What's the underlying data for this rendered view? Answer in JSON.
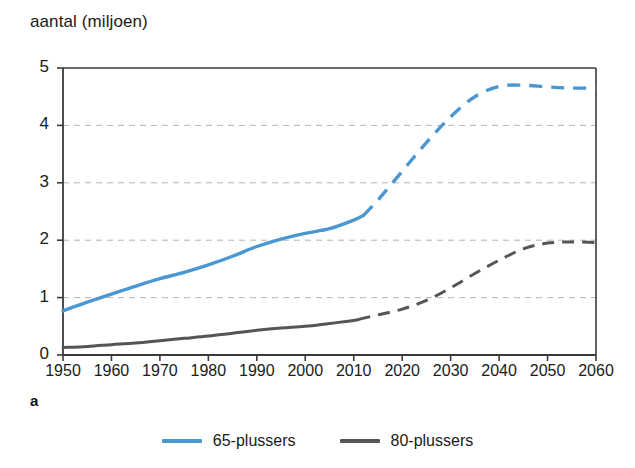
{
  "figure": {
    "axis_title": "aantal (miljoen)",
    "panel_label": "a"
  },
  "legend": {
    "position": "bottom-center",
    "entries": [
      {
        "label": "65-plussers",
        "color": "#4a97d2"
      },
      {
        "label": "80-plussers",
        "color": "#555555"
      }
    ]
  },
  "axes": {
    "y_ticks": [
      "0",
      "1",
      "2",
      "3",
      "4",
      "5"
    ],
    "x_ticks": [
      "1950",
      "1960",
      "1970",
      "1980",
      "1990",
      "2000",
      "2010",
      "2020",
      "2030",
      "2040",
      "2050",
      "2060"
    ]
  },
  "chart_data": {
    "type": "line",
    "title": "",
    "subtitle": "",
    "xlabel": "",
    "ylabel": "aantal (miljoen)",
    "xlim": [
      1950,
      2060
    ],
    "ylim": [
      0,
      5
    ],
    "grid": "horizontal-dashed",
    "legend_position": "bottom-center",
    "annotations": [
      "a"
    ],
    "x_ticks": [
      1950,
      1960,
      1970,
      1980,
      1990,
      2000,
      2010,
      2020,
      2030,
      2040,
      2050,
      2060
    ],
    "y_ticks": [
      0,
      1,
      2,
      3,
      4,
      5
    ],
    "series": [
      {
        "name": "65-plussers",
        "color": "#4a97d2",
        "observed_until": 2012,
        "x": [
          1950,
          1955,
          1960,
          1965,
          1970,
          1975,
          1980,
          1985,
          1990,
          1995,
          2000,
          2005,
          2010,
          2012,
          2015,
          2020,
          2025,
          2030,
          2035,
          2040,
          2045,
          2050,
          2055,
          2060
        ],
        "values": [
          0.77,
          0.92,
          1.06,
          1.2,
          1.33,
          1.44,
          1.57,
          1.72,
          1.89,
          2.02,
          2.12,
          2.2,
          2.35,
          2.43,
          2.7,
          3.2,
          3.7,
          4.15,
          4.5,
          4.68,
          4.7,
          4.67,
          4.65,
          4.65
        ],
        "style_observed": "solid",
        "style_projected": "dashed"
      },
      {
        "name": "80-plussers",
        "color": "#555555",
        "observed_until": 2011,
        "x": [
          1950,
          1955,
          1960,
          1965,
          1970,
          1975,
          1980,
          1985,
          1990,
          1995,
          2000,
          2005,
          2010,
          2011,
          2015,
          2020,
          2025,
          2030,
          2035,
          2040,
          2045,
          2050,
          2055,
          2060
        ],
        "values": [
          0.13,
          0.15,
          0.18,
          0.21,
          0.25,
          0.29,
          0.33,
          0.38,
          0.43,
          0.47,
          0.5,
          0.55,
          0.6,
          0.62,
          0.7,
          0.8,
          0.95,
          1.17,
          1.42,
          1.65,
          1.85,
          1.95,
          1.97,
          1.96
        ],
        "style_observed": "solid",
        "style_projected": "dashed"
      }
    ]
  }
}
